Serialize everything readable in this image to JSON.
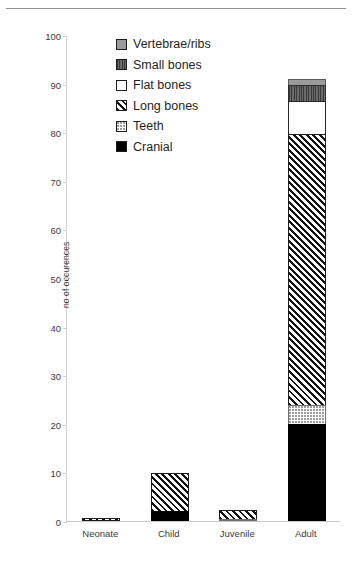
{
  "chart_data": {
    "type": "bar",
    "subtype": "stacked-vertical",
    "title": "",
    "xlabel": "",
    "ylabel": "no of occurences",
    "ylim": [
      0,
      100
    ],
    "ytick_step": 10,
    "yticks": [
      0,
      10,
      20,
      30,
      40,
      50,
      60,
      70,
      80,
      90,
      100
    ],
    "grid": false,
    "legend_position": "inside-top-left",
    "categories": [
      "Neonate",
      "Child",
      "Juvenile",
      "Adult"
    ],
    "series": [
      {
        "name": "Cranial",
        "pattern": "solid-black",
        "color": "#000000",
        "values": [
          0,
          2,
          0,
          20
        ]
      },
      {
        "name": "Teeth",
        "pattern": "light-dotted",
        "color": "#ffffff",
        "values": [
          0,
          0,
          0.4,
          4
        ]
      },
      {
        "name": "Long bones",
        "pattern": "diagonal-hatch",
        "color": "#ffffff",
        "values": [
          0.7,
          8,
          2.1,
          56
        ]
      },
      {
        "name": "Flat bones",
        "pattern": "white-outline",
        "color": "#ffffff",
        "values": [
          0,
          0,
          0,
          7
        ]
      },
      {
        "name": "Small bones",
        "pattern": "dark-gray-hatch",
        "color": "#5b5b5b",
        "values": [
          0,
          0,
          0,
          3.5
        ]
      },
      {
        "name": "Vertebrae/ribs",
        "pattern": "gray-solid",
        "color": "#9b9b9b",
        "values": [
          0,
          0,
          0,
          1.5
        ]
      }
    ],
    "totals": [
      0.7,
      10,
      2.5,
      92
    ],
    "legend_order": [
      "Vertebrae/ribs",
      "Small bones",
      "Flat bones",
      "Long bones",
      "Teeth",
      "Cranial"
    ]
  },
  "axis": {
    "y_title": "no of occurences",
    "y_labels": [
      "100",
      "90",
      "80",
      "70",
      "60",
      "50",
      "40",
      "30",
      "20",
      "10",
      "0"
    ]
  },
  "legend": {
    "items": [
      {
        "label": "Vertebrae/ribs",
        "swatch": "vert"
      },
      {
        "label": "Small bones",
        "swatch": "small"
      },
      {
        "label": "Flat bones",
        "swatch": "flat"
      },
      {
        "label": "Long bones",
        "swatch": "long"
      },
      {
        "label": "Teeth",
        "swatch": "teeth"
      },
      {
        "label": "Cranial",
        "swatch": "cranial"
      }
    ]
  },
  "xaxis": {
    "labels": [
      "Neonate",
      "Child",
      "Juvenile",
      "Adult"
    ]
  }
}
